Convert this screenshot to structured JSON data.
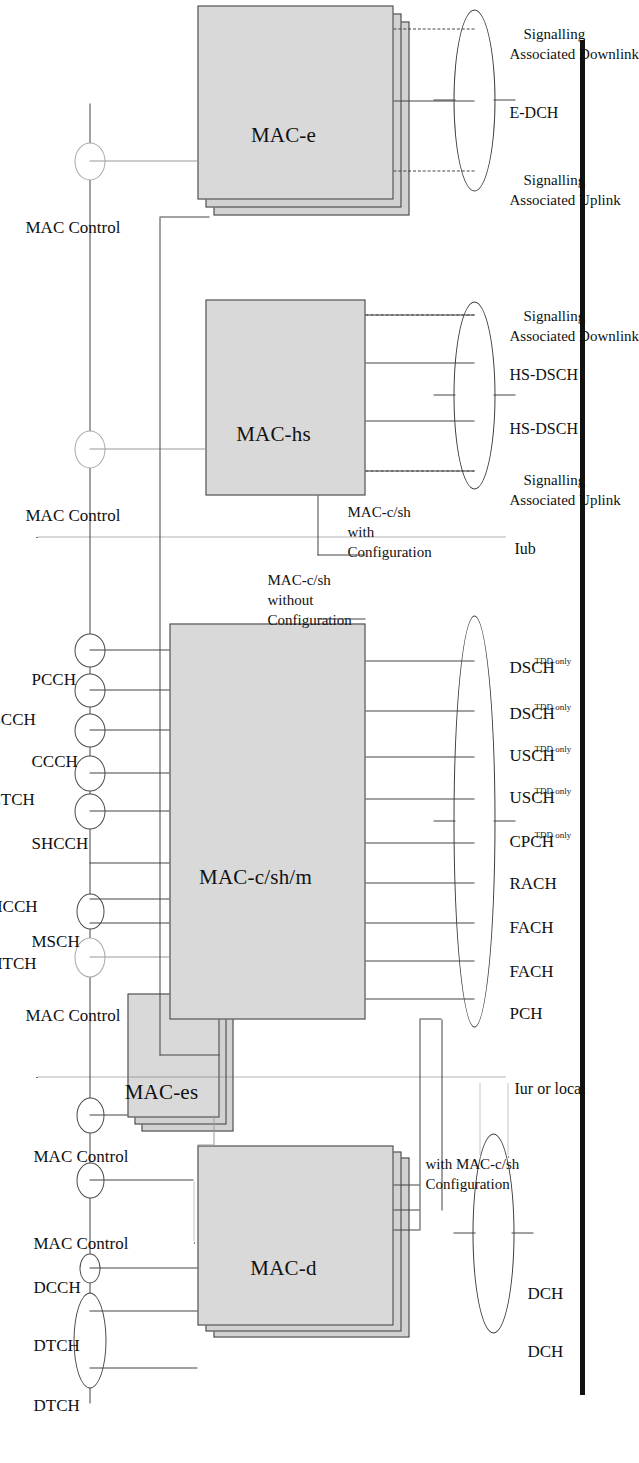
{
  "figure": {
    "colors": {
      "box_fill": "#d9d9d9",
      "box_stroke": "#3a3a3a",
      "line": "#444444",
      "light_line": "#9a9a9a",
      "gutter_bar": "#121212"
    }
  },
  "entities": [
    {
      "id": "mac-d",
      "label": "MAC-d",
      "stacked": true,
      "layers": 3
    },
    {
      "id": "mac-es",
      "label": "MAC-es",
      "stacked": true,
      "layers": 3
    },
    {
      "id": "mac-c-sh-m",
      "label": "MAC-c/sh/m",
      "stacked": false,
      "layers": 1
    },
    {
      "id": "mac-hs",
      "label": "MAC-hs",
      "stacked": false,
      "layers": 1
    },
    {
      "id": "mac-e",
      "label": "MAC-e",
      "stacked": true,
      "layers": 3
    }
  ],
  "logical_channels": {
    "dedicated_group": [
      "MAC Control",
      "MAC Control",
      "DCCH",
      "DTCH",
      "DTCH"
    ],
    "common_group_top": [
      "MAC Control"
    ],
    "common_group": [
      "PCCH",
      "BCCH",
      "CCCH",
      "CTCH",
      "SHCCH",
      "MCCH",
      "MTCH",
      "MSCH"
    ],
    "hs_control": "MAC Control",
    "e_control": "MAC Control"
  },
  "transport_channels": {
    "dedicated": [
      "DCH",
      "DCH"
    ],
    "common": [
      "PCH",
      "FACH",
      "FACH",
      "RACH",
      "CPCH",
      "USCH",
      "USCH",
      "DSCH",
      "DSCH"
    ],
    "common_notes": [
      "",
      "",
      "",
      "",
      "TDD only",
      "TDD only",
      "TDD only",
      "TDD only",
      "TDD only"
    ],
    "hs": [
      "HS-DSCH",
      "HS-DSCH"
    ],
    "e": [
      "E-DCH"
    ]
  },
  "signalling_labels": {
    "hs_down_line1": "Associated Downlink",
    "hs_down_line2": "Signalling",
    "hs_up_line1": "Associated Uplink",
    "hs_up_line2": "Signalling",
    "e_down_line1": "Associated Downlink",
    "e_down_line2": "Signalling",
    "e_up_line1": "Associated Uplink",
    "e_up_line2": "Signalling"
  },
  "configuration_labels": {
    "with_mac_c_sh_top_line1": "Configuration",
    "with_mac_c_sh_top_line2": "with MAC-c/sh",
    "without_line1": "Configuration",
    "without_line2": "without",
    "without_line3": "MAC-c/sh",
    "with_line1": "Configuration",
    "with_line2": "with",
    "with_line3": "MAC-c/sh"
  },
  "interfaces": {
    "iur_or_local": "Iur or local",
    "iub": "Iub"
  }
}
